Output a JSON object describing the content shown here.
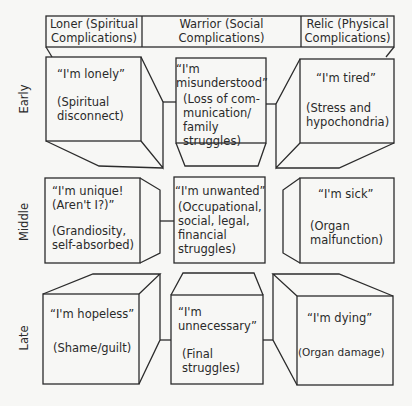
{
  "columns": [
    {
      "label_line1": "Loner (Spiritual",
      "label_line2": "Complications)"
    },
    {
      "label_line1": "Warrior (Social",
      "label_line2": "Complications)"
    },
    {
      "label_line1": "Relic (Physical",
      "label_line2": "Complications)"
    }
  ],
  "rows": [
    {
      "label": "Early"
    },
    {
      "label": "Middle"
    },
    {
      "label": "Late"
    }
  ],
  "cells": {
    "early_loner": {
      "quote": "“I'm lonely”",
      "desc": "(Spiritual disconnect)"
    },
    "early_warrior": {
      "quote": "“I'm misunderstood”",
      "desc": "(Loss of com-munication/ family struggles)"
    },
    "early_relic": {
      "quote": "“I'm tired”",
      "desc": "(Stress and hypochondria)"
    },
    "middle_loner": {
      "quote": "“I'm unique! (Aren't I?)”",
      "desc": "(Grandiosity, self-absorbed)"
    },
    "middle_warrior": {
      "quote": "“I'm unwanted”",
      "desc": "(Occupational, social, legal, financial struggles)"
    },
    "middle_relic": {
      "quote": "“I'm sick”",
      "desc": "(Organ malfunction)"
    },
    "late_loner": {
      "quote": "“I'm hopeless”",
      "desc": "(Shame/guilt)"
    },
    "late_warrior": {
      "quote": "“I'm unnecessary”",
      "desc": "(Final struggles)"
    },
    "late_relic": {
      "quote": "“I'm dying”",
      "desc": "(Organ damage)"
    }
  }
}
